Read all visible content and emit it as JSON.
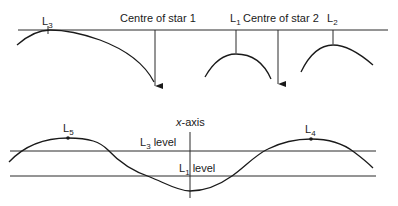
{
  "top_diagram": {
    "labels": {
      "l3": {
        "main": "L",
        "sub": "3"
      },
      "centre_star1": "Centre of star 1",
      "l1": {
        "main": "L",
        "sub": "1"
      },
      "centre_star2": "Centre of star 2",
      "l2": {
        "main": "L",
        "sub": "2"
      }
    }
  },
  "bottom_diagram": {
    "labels": {
      "x_axis": "x-axis",
      "l5": {
        "main": "L",
        "sub": "5"
      },
      "l4": {
        "main": "L",
        "sub": "4"
      },
      "l3_level": {
        "main": "L",
        "sub": "3",
        "suffix": " level"
      },
      "l1_level": {
        "main": "L",
        "sub": "1",
        "suffix": " level"
      }
    }
  },
  "colors": {
    "stroke": "#1a1a1a",
    "background": "#ffffff"
  }
}
